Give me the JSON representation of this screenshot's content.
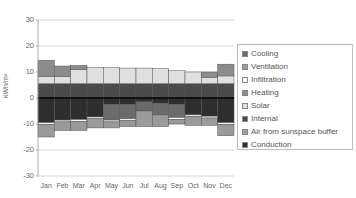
{
  "chart_data": {
    "type": "bar",
    "stacked": true,
    "title": "",
    "xlabel": "",
    "ylabel": "kWh/m²",
    "ylim": [
      -30,
      30
    ],
    "yticks": [
      30,
      20,
      10,
      0,
      -10,
      -20,
      -30
    ],
    "grid": "horizontal",
    "legend_position": "right",
    "categories": [
      "Jan",
      "Feb",
      "Mar",
      "Apr",
      "May",
      "Jun",
      "Jul",
      "Aug",
      "Sep",
      "Oct",
      "Nov",
      "Dec"
    ],
    "series": [
      {
        "name": "Cooling",
        "color": "#6b6b6b",
        "values": [
          0,
          0,
          0,
          0,
          0,
          0,
          0,
          0,
          0,
          0,
          0,
          0
        ]
      },
      {
        "name": "Ventilation",
        "color": "#9a9a9a",
        "values": [
          0,
          0,
          0,
          0,
          0,
          0,
          0,
          0,
          0,
          0,
          0,
          0
        ]
      },
      {
        "name": "Infiltration",
        "color": "#e6e6e6",
        "values": [
          0,
          0,
          0,
          0,
          0,
          0,
          0,
          0,
          0,
          0,
          0,
          0
        ]
      },
      {
        "name": "Heating",
        "color": "#8c8c8c",
        "values": [
          6.5,
          4,
          1.5,
          0,
          0,
          0,
          0,
          0,
          0,
          0,
          1.5,
          4.5
        ]
      },
      {
        "name": "Solar",
        "color": "#dadada",
        "values": [
          3,
          3,
          5.5,
          6,
          6,
          6,
          6,
          6,
          5,
          4.5,
          3,
          3
        ]
      },
      {
        "name": "Internal",
        "color": "#4a4a4a",
        "values": [
          5.5,
          5.5,
          5.5,
          5.5,
          5.5,
          5.5,
          5.5,
          5.5,
          5.5,
          5.5,
          5.5,
          5.5
        ]
      },
      {
        "name": "Air from sunspace buffer",
        "color": "#a0a0a0",
        "values": [
          0,
          0,
          0,
          0,
          0,
          0,
          0,
          0,
          0,
          0,
          0,
          0
        ]
      },
      {
        "name": "Conduction",
        "color": "#3a3a3a",
        "values": [
          0,
          0,
          0,
          0,
          0,
          0,
          0,
          0,
          0,
          0,
          0,
          0
        ]
      }
    ],
    "negative_stacks": [
      [
        {
          "s": "Conduction",
          "v": -9.5
        },
        {
          "s": "Infiltration",
          "v": -0.7
        },
        {
          "s": "Ventilation",
          "v": -4.8
        }
      ],
      [
        {
          "s": "Conduction",
          "v": -8.5
        },
        {
          "s": "Infiltration",
          "v": -0.7
        },
        {
          "s": "Ventilation",
          "v": -3.3
        }
      ],
      [
        {
          "s": "Conduction",
          "v": -8.3
        },
        {
          "s": "Infiltration",
          "v": -0.7
        },
        {
          "s": "Ventilation",
          "v": -3.5
        }
      ],
      [
        {
          "s": "Conduction",
          "v": -7.3
        },
        {
          "s": "Infiltration",
          "v": -0.7
        },
        {
          "s": "Ventilation",
          "v": -3.5
        }
      ],
      [
        {
          "s": "Conduction",
          "v": -2.5
        },
        {
          "s": "Cooling",
          "v": -6
        },
        {
          "s": "Infiltration",
          "v": -0.7
        },
        {
          "s": "Ventilation",
          "v": -2.3
        }
      ],
      [
        {
          "s": "Conduction",
          "v": -2.5
        },
        {
          "s": "Cooling",
          "v": -5.5
        },
        {
          "s": "Infiltration",
          "v": -0.7
        },
        {
          "s": "Ventilation",
          "v": -2.3
        }
      ],
      [
        {
          "s": "Conduction",
          "v": -1.5
        },
        {
          "s": "Cooling",
          "v": -3.5
        },
        {
          "s": "Ventilation",
          "v": -6
        }
      ],
      [
        {
          "s": "Conduction",
          "v": -2
        },
        {
          "s": "Cooling",
          "v": -4.5
        },
        {
          "s": "Ventilation",
          "v": -4.5
        }
      ],
      [
        {
          "s": "Conduction",
          "v": -2.5
        },
        {
          "s": "Cooling",
          "v": -5
        },
        {
          "s": "Infiltration",
          "v": -0.7
        },
        {
          "s": "Ventilation",
          "v": -1.8
        }
      ],
      [
        {
          "s": "Conduction",
          "v": -6.5
        },
        {
          "s": "Infiltration",
          "v": -0.7
        },
        {
          "s": "Ventilation",
          "v": -3.3
        }
      ],
      [
        {
          "s": "Conduction",
          "v": -7
        },
        {
          "s": "Infiltration",
          "v": -0.7
        },
        {
          "s": "Ventilation",
          "v": -2.8
        }
      ],
      [
        {
          "s": "Conduction",
          "v": -9.5
        },
        {
          "s": "Infiltration",
          "v": -0.7
        },
        {
          "s": "Ventilation",
          "v": -4.3
        }
      ]
    ],
    "positive_stacks": [
      [
        {
          "s": "Internal",
          "v": 5.5
        },
        {
          "s": "Solar",
          "v": 2.8
        },
        {
          "s": "Heating",
          "v": 6.2
        }
      ],
      [
        {
          "s": "Internal",
          "v": 5.5
        },
        {
          "s": "Solar",
          "v": 2.8
        },
        {
          "s": "Heating",
          "v": 4
        }
      ],
      [
        {
          "s": "Internal",
          "v": 5.5
        },
        {
          "s": "Solar",
          "v": 5.5
        },
        {
          "s": "Heating",
          "v": 1.5
        }
      ],
      [
        {
          "s": "Internal",
          "v": 5.5
        },
        {
          "s": "Solar",
          "v": 6.2
        }
      ],
      [
        {
          "s": "Internal",
          "v": 5.5
        },
        {
          "s": "Solar",
          "v": 6.2
        }
      ],
      [
        {
          "s": "Internal",
          "v": 5.5
        },
        {
          "s": "Solar",
          "v": 6
        }
      ],
      [
        {
          "s": "Internal",
          "v": 5.5
        },
        {
          "s": "Solar",
          "v": 6
        }
      ],
      [
        {
          "s": "Internal",
          "v": 5.5
        },
        {
          "s": "Solar",
          "v": 5.8
        }
      ],
      [
        {
          "s": "Internal",
          "v": 5.5
        },
        {
          "s": "Solar",
          "v": 5
        }
      ],
      [
        {
          "s": "Internal",
          "v": 5.5
        },
        {
          "s": "Solar",
          "v": 4.5
        }
      ],
      [
        {
          "s": "Internal",
          "v": 5.5
        },
        {
          "s": "Solar",
          "v": 2.5
        },
        {
          "s": "Heating",
          "v": 2
        }
      ],
      [
        {
          "s": "Internal",
          "v": 5.5
        },
        {
          "s": "Solar",
          "v": 3
        },
        {
          "s": "Heating",
          "v": 4.5
        }
      ]
    ]
  },
  "legend": {
    "items": [
      {
        "label": "Cooling",
        "color": "#6b6b6b"
      },
      {
        "label": "Ventilation",
        "color": "#9a9a9a"
      },
      {
        "label": "Infiltration",
        "color": "#f4f4f4"
      },
      {
        "label": "Heating",
        "color": "#8c8c8c"
      },
      {
        "label": "Solar",
        "color": "#e0e0e0"
      },
      {
        "label": "Internal",
        "color": "#4a4a4a"
      },
      {
        "label": "Air from sunspace buffer",
        "color": "#a0a0a0"
      },
      {
        "label": "Conduction",
        "color": "#2e2e2e"
      }
    ]
  }
}
